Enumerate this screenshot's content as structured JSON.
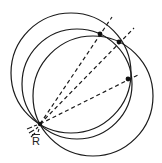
{
  "diagram": {
    "stroke_color": "#1a1a1a",
    "background": "#ffffff",
    "point_label": "R",
    "point_label_overbar": true,
    "common_point": {
      "x": 40,
      "y": 124
    },
    "circles": [
      {
        "name": "circle-a",
        "cx": 71,
        "cy": 73,
        "r": 60
      },
      {
        "name": "circle-b",
        "cx": 77,
        "cy": 84,
        "r": 55
      },
      {
        "name": "circle-c",
        "cx": 93,
        "cy": 96,
        "r": 60
      }
    ],
    "intersection_points": [
      {
        "x": 100,
        "y": 34
      },
      {
        "x": 119,
        "y": 42
      },
      {
        "x": 128,
        "y": 79
      }
    ],
    "rays": [
      {
        "from": [
          40,
          124
        ],
        "to": [
          112,
          17
        ]
      },
      {
        "from": [
          40,
          124
        ],
        "to": [
          134,
          28
        ]
      },
      {
        "from": [
          40,
          124
        ],
        "to": [
          140,
          74
        ]
      }
    ]
  }
}
